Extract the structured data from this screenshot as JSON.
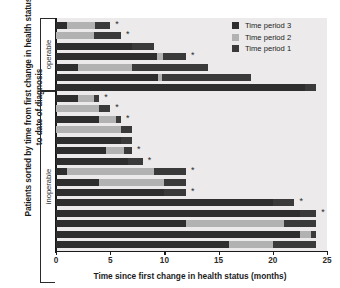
{
  "chart_data": {
    "type": "bar",
    "orientation": "horizontal",
    "stacked": true,
    "title": "",
    "xlabel": "Time since first change in health status (months)",
    "ylabel": "Patients sorted by time from first change in health status to date of diagnosis",
    "xlim": [
      0,
      25
    ],
    "xticks": [
      0,
      5,
      10,
      15,
      20,
      25
    ],
    "xticklabels": [
      "0",
      "5",
      "10",
      "15",
      "20",
      "25"
    ],
    "grid": false,
    "legend_position": "top-right",
    "series": [
      {
        "name": "Time period 3",
        "color": "#2e2e2e"
      },
      {
        "name": "Time period 2",
        "color": "#b2b2b2"
      },
      {
        "name": "Time period 1",
        "color": "#3a3a3a"
      }
    ],
    "groups": [
      {
        "label": "operable",
        "n": 7
      },
      {
        "label": "inoperable",
        "n": 18
      }
    ],
    "bars": [
      {
        "group": "operable",
        "segments": [
          1.0,
          2.6,
          1.4
        ],
        "total": 5.0,
        "star": true
      },
      {
        "group": "operable",
        "segments": [
          0.0,
          3.5,
          2.5
        ],
        "total": 6.0,
        "star": true
      },
      {
        "group": "operable",
        "segments": [
          7.0,
          0.0,
          2.0
        ],
        "total": 9.0,
        "star": false
      },
      {
        "group": "operable",
        "segments": [
          9.3,
          0.6,
          2.1
        ],
        "total": 12.0,
        "star": true
      },
      {
        "group": "operable",
        "segments": [
          2.0,
          5.0,
          7.0
        ],
        "total": 14.0,
        "star": false
      },
      {
        "group": "operable",
        "segments": [
          9.4,
          0.4,
          8.2
        ],
        "total": 18.0,
        "star": false
      },
      {
        "group": "operable",
        "segments": [
          23.0,
          0.0,
          1.0
        ],
        "total": 24.0,
        "star": false
      },
      {
        "group": "inoperable",
        "segments": [
          2.0,
          1.5,
          0.5
        ],
        "total": 4.0,
        "star": true
      },
      {
        "group": "inoperable",
        "segments": [
          0.0,
          4.0,
          1.0
        ],
        "total": 5.0,
        "star": true
      },
      {
        "group": "inoperable",
        "segments": [
          4.0,
          1.5,
          0.5
        ],
        "total": 6.0,
        "star": true
      },
      {
        "group": "inoperable",
        "segments": [
          0.0,
          6.0,
          1.0
        ],
        "total": 7.0,
        "star": false
      },
      {
        "group": "inoperable",
        "segments": [
          6.0,
          0.0,
          1.0
        ],
        "total": 7.0,
        "star": false
      },
      {
        "group": "inoperable",
        "segments": [
          4.6,
          1.7,
          0.7
        ],
        "total": 7.0,
        "star": true
      },
      {
        "group": "inoperable",
        "segments": [
          6.6,
          0.0,
          1.4
        ],
        "total": 8.0,
        "star": true
      },
      {
        "group": "inoperable",
        "segments": [
          1.0,
          8.0,
          3.0
        ],
        "total": 12.0,
        "star": true
      },
      {
        "group": "inoperable",
        "segments": [
          4.0,
          6.0,
          2.0
        ],
        "total": 12.0,
        "star": false
      },
      {
        "group": "inoperable",
        "segments": [
          10.0,
          0.0,
          2.0
        ],
        "total": 12.0,
        "star": true
      },
      {
        "group": "inoperable",
        "segments": [
          20.0,
          0.0,
          2.0
        ],
        "total": 22.0,
        "star": true
      },
      {
        "group": "inoperable",
        "segments": [
          22.5,
          0.0,
          1.5
        ],
        "total": 24.0,
        "star": true
      },
      {
        "group": "inoperable",
        "segments": [
          12.0,
          9.0,
          3.0
        ],
        "total": 24.0,
        "star": false
      },
      {
        "group": "inoperable",
        "segments": [
          22.5,
          1.0,
          0.5
        ],
        "total": 24.0,
        "star": false
      },
      {
        "group": "inoperable",
        "segments": [
          16.0,
          4.0,
          4.0
        ],
        "total": 24.0,
        "star": false
      }
    ]
  },
  "yaxis": {
    "caption": "Patients sorted by time from first change in health status to date of diagnosis",
    "group_operable": "operable",
    "group_inoperable": "inoperable"
  },
  "xaxis": {
    "caption": "Time since first change in health status (months)",
    "tick_0": "0",
    "tick_1": "5",
    "tick_2": "10",
    "tick_3": "15",
    "tick_4": "20",
    "tick_5": "25"
  },
  "legend": {
    "item_3": "Time period 3",
    "item_2": "Time period 2",
    "item_1": "Time period 1"
  },
  "annotation": {
    "star": "*"
  },
  "colors": {
    "period3": "#2e2e2e",
    "period2": "#b2b2b2",
    "period1": "#3a3a3a",
    "plot_bg": "#eceaea",
    "axis": "#1a1a1a"
  }
}
